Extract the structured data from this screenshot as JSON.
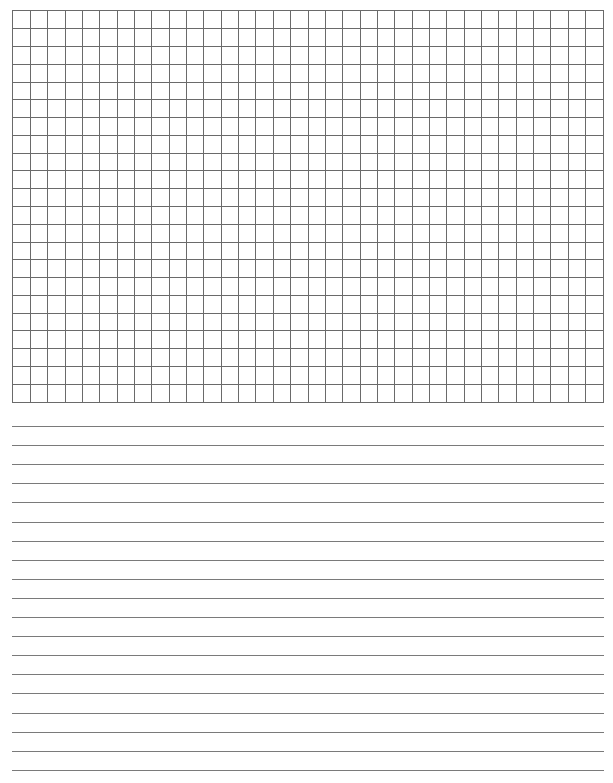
{
  "page": {
    "type": "graph-and-lined-paper",
    "background_color": "#ffffff",
    "line_color": "#6a6a6a"
  },
  "grid_section": {
    "columns": 34,
    "rows": 22,
    "left": 12,
    "top": 10,
    "width": 592,
    "height": 393
  },
  "ruled_section": {
    "line_count": 19,
    "first_line_y": 426,
    "spacing": 19.1,
    "left": 12,
    "width": 592
  }
}
